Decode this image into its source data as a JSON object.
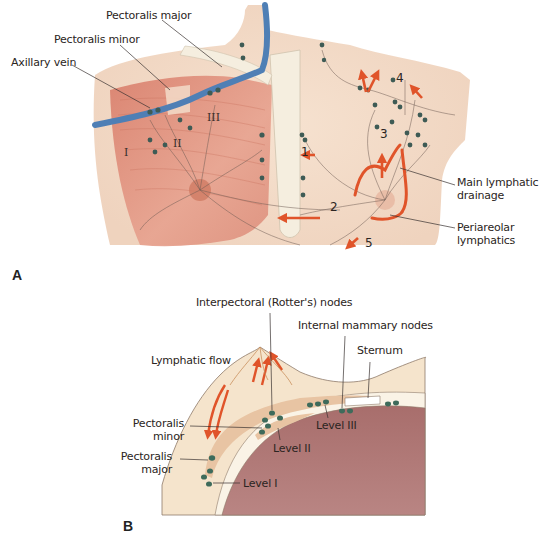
{
  "panel_a": {
    "panel_letter": "A",
    "labels": {
      "pectoralis_major": "Pectoralis major",
      "pectoralis_minor": "Pectoralis minor",
      "axillary_vein": "Axillary vein",
      "main_lymphatic_drainage_1": "Main lymphatic",
      "main_lymphatic_drainage_2": "drainage",
      "periareolar_1": "Periareolar",
      "periareolar_2": "lymphatics"
    },
    "levels": {
      "I": "I",
      "II": "II",
      "III": "III"
    },
    "pathways": {
      "p1": "1",
      "p2": "2",
      "p3": "3",
      "p4": "4",
      "p5": "5"
    }
  },
  "panel_b": {
    "panel_letter": "B",
    "labels": {
      "interpectoral": "Interpectoral (Rotter's) nodes",
      "internal_mammary": "Internal mammary nodes",
      "sternum": "Sternum",
      "lymphatic_flow": "Lymphatic flow",
      "pectoralis_minor_1": "Pectoralis",
      "pectoralis_minor_2": "minor",
      "pectoralis_major_1": "Pectoralis",
      "pectoralis_major_2": "major",
      "level_1": "Level I",
      "level_2": "Level II",
      "level_3": "Level III"
    }
  },
  "colors": {
    "skin": "#f3dcc8",
    "muscle": "#d98a78",
    "vein": "#4f7fb5",
    "lymph_arrow": "#e0542a",
    "node": "#3e6b5b",
    "lung": "#a8706e",
    "bone": "#f5eedf"
  }
}
